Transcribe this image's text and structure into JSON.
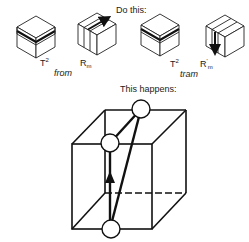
{
  "instructions": {
    "do_this": "Do this:",
    "this_happens": "This happens:"
  },
  "moves": [
    {
      "id": "T2-from",
      "base": "T",
      "sup": "2",
      "sub": "",
      "prime": "",
      "icon": "cube-top-layer-half-turn-icon"
    },
    {
      "id": "Rm-from",
      "base": "R",
      "sup": "",
      "sub": "m",
      "prime": "",
      "icon": "cube-middle-slice-turn-icon"
    },
    {
      "id": "T2-tram",
      "base": "T",
      "sup": "2",
      "sub": "",
      "prime": "",
      "icon": "cube-top-layer-half-turn-icon"
    },
    {
      "id": "Rm-prime-tram",
      "base": "R",
      "sup": "",
      "sub": "m",
      "prime": "'",
      "icon": "cube-middle-slice-inverse-turn-icon"
    }
  ],
  "sequence_names": {
    "first": "from",
    "second": "tram"
  },
  "result_diagram": {
    "description": "Three-cycle of edge pieces on large wireframe cube",
    "circle_count": 3,
    "arrow": "upward"
  },
  "colors": {
    "line": "#111111",
    "background": "#ffffff"
  }
}
